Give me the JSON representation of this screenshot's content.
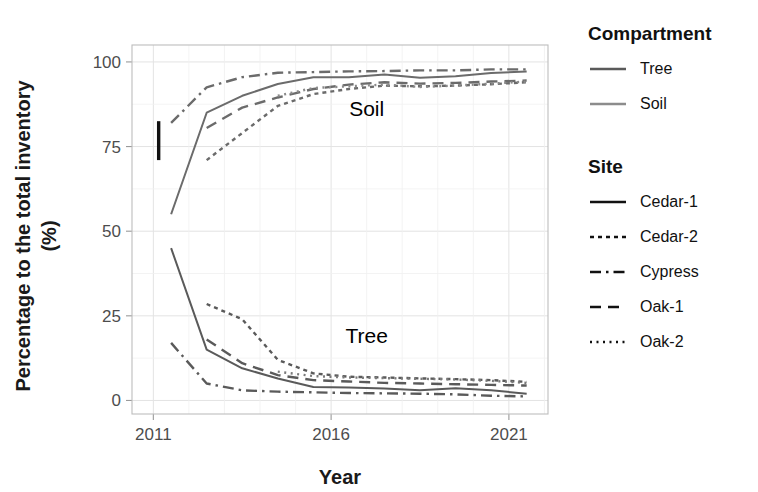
{
  "chart_data": {
    "type": "line",
    "title": "",
    "xlabel": "Year",
    "ylabel": "Percentage to the total inventory (%)",
    "ylabel_line1": "Percentage to the total inventory",
    "ylabel_line2": "(%)",
    "xlim": [
      2010.4,
      2022.1
    ],
    "ylim": [
      -4,
      105
    ],
    "x_ticks": [
      2011,
      2016,
      2021
    ],
    "x_tick_labels": [
      "2011",
      "2016",
      "2021"
    ],
    "x_minor_ticks": [
      2012,
      2013,
      2014,
      2015,
      2017,
      2018,
      2019,
      2020,
      2022
    ],
    "y_ticks": [
      0,
      25,
      50,
      75,
      100
    ],
    "y_tick_labels": [
      "0",
      "25",
      "50",
      "75",
      "100"
    ],
    "grid": true,
    "legend_position": "right",
    "annotations": [
      {
        "name": "soil-group-label",
        "text": "Soil",
        "x": 2017.0,
        "y": 84.0
      },
      {
        "name": "tree-group-label",
        "text": "Tree",
        "x": 2017.0,
        "y": 17.0
      }
    ],
    "errorbar": {
      "x": 2011.15,
      "y_low": 71.0,
      "y_high": 82.5
    },
    "x": [
      2011.5,
      2012.5,
      2013.5,
      2014.5,
      2015.5,
      2016.5,
      2017.5,
      2018.5,
      2019.5,
      2020.5,
      2021.5
    ],
    "series": [
      {
        "name": "Soil Cedar-1",
        "compartment": "Soil",
        "site": "Cedar-1",
        "dash": "solid",
        "color": "#6b6b6b",
        "values": [
          55.0,
          85.0,
          90.0,
          93.5,
          95.5,
          95.5,
          96.3,
          95.3,
          95.8,
          96.7,
          97.2
        ]
      },
      {
        "name": "Soil Cedar-2",
        "compartment": "Soil",
        "site": "Cedar-2",
        "dash": "dotted-dense",
        "color": "#6b6b6b",
        "values": [
          null,
          71.0,
          79.0,
          87.0,
          90.5,
          92.0,
          93.0,
          92.8,
          93.0,
          93.4,
          94.0
        ]
      },
      {
        "name": "Soil Cypress",
        "compartment": "Soil",
        "site": "Cypress",
        "dash": "dashdot",
        "color": "#6b6b6b",
        "values": [
          82.0,
          92.5,
          95.5,
          96.8,
          97.0,
          97.2,
          97.3,
          97.5,
          97.5,
          97.8,
          97.8
        ]
      },
      {
        "name": "Soil Oak-1",
        "compartment": "Soil",
        "site": "Oak-1",
        "dash": "dashed",
        "color": "#6b6b6b",
        "values": [
          null,
          80.5,
          86.5,
          89.5,
          92.0,
          93.3,
          94.0,
          93.6,
          93.8,
          94.2,
          94.5
        ]
      },
      {
        "name": "Soil Oak-2",
        "compartment": "Soil",
        "site": "Oak-2",
        "dash": "dotted-fine",
        "color": "#8a8a8a",
        "values": [
          null,
          null,
          null,
          90.0,
          92.3,
          92.8,
          93.3,
          92.6,
          93.0,
          93.6,
          94.2
        ]
      },
      {
        "name": "Tree Cedar-1",
        "compartment": "Tree",
        "site": "Cedar-1",
        "dash": "solid",
        "color": "#5a5a5a",
        "values": [
          45.0,
          15.0,
          9.5,
          6.5,
          4.0,
          3.8,
          3.5,
          3.0,
          3.6,
          3.0,
          2.0
        ]
      },
      {
        "name": "Tree Cedar-2",
        "compartment": "Tree",
        "site": "Cedar-2",
        "dash": "dotted-dense",
        "color": "#5a5a5a",
        "values": [
          null,
          28.5,
          24.0,
          12.0,
          8.0,
          7.0,
          6.8,
          6.5,
          6.3,
          6.0,
          5.5
        ]
      },
      {
        "name": "Tree Cypress",
        "compartment": "Tree",
        "site": "Cypress",
        "dash": "dashdot",
        "color": "#5a5a5a",
        "values": [
          17.0,
          5.0,
          3.0,
          2.6,
          2.4,
          2.2,
          2.1,
          2.0,
          1.8,
          1.4,
          1.2
        ]
      },
      {
        "name": "Tree Oak-1",
        "compartment": "Tree",
        "site": "Oak-1",
        "dash": "dashed",
        "color": "#5a5a5a",
        "values": [
          null,
          18.0,
          11.0,
          7.5,
          6.0,
          5.6,
          5.2,
          5.0,
          4.8,
          4.6,
          4.4
        ]
      },
      {
        "name": "Tree Oak-2",
        "compartment": "Tree",
        "site": "Oak-2",
        "dash": "dotted-fine",
        "color": "#7a7a7a",
        "values": [
          null,
          null,
          null,
          8.5,
          7.2,
          6.8,
          6.6,
          6.4,
          6.2,
          5.8,
          5.2
        ]
      }
    ]
  },
  "legends": [
    {
      "id": "compartment",
      "title": "Compartment",
      "items": [
        {
          "label": "Tree",
          "color": "#5a5a5a",
          "dash": "solid"
        },
        {
          "label": "Soil",
          "color": "#8c8c8c",
          "dash": "solid"
        }
      ]
    },
    {
      "id": "site",
      "title": "Site",
      "items": [
        {
          "label": "Cedar-1",
          "color": "#111111",
          "dash": "solid"
        },
        {
          "label": "Cedar-2",
          "color": "#111111",
          "dash": "dotted-dense"
        },
        {
          "label": "Cypress",
          "color": "#111111",
          "dash": "dashdot"
        },
        {
          "label": "Oak-1",
          "color": "#111111",
          "dash": "dashed"
        },
        {
          "label": "Oak-2",
          "color": "#111111",
          "dash": "dotted-fine"
        }
      ]
    }
  ]
}
